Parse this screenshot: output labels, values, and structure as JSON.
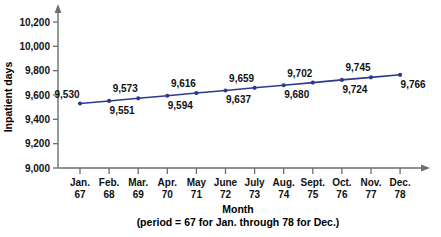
{
  "chart_data": {
    "type": "line",
    "title": "",
    "xlabel": "Month",
    "xlabel_sub": "(period = 67 for Jan. through 78 for Dec.)",
    "ylabel": "Inpatient days",
    "ylim": [
      9000,
      10200
    ],
    "ytick_step": 200,
    "grid": false,
    "legend": "none",
    "series_color": "#2b3a8f",
    "axis_color": "#6e6e6e",
    "categories": [
      "Jan.",
      "Feb.",
      "Mar.",
      "Apr.",
      "May",
      "June",
      "July",
      "Aug.",
      "Sept.",
      "Oct.",
      "Nov.",
      "Dec."
    ],
    "periods": [
      "67",
      "68",
      "69",
      "70",
      "71",
      "72",
      "73",
      "74",
      "75",
      "76",
      "77",
      "78"
    ],
    "values": [
      9530,
      9551,
      9573,
      9594,
      9616,
      9637,
      9659,
      9680,
      9702,
      9724,
      9745,
      9766
    ],
    "point_labels": [
      "9,530",
      "9,551",
      "9,573",
      "9,594",
      "9,616",
      "9,637",
      "9,659",
      "9,680",
      "9,702",
      "9,724",
      "9,745",
      "9,766"
    ],
    "ytick_labels": [
      "9,000",
      "9,200",
      "9,400",
      "9,600",
      "9,800",
      "10,000",
      "10,200"
    ],
    "ytick_values": [
      9000,
      9200,
      9400,
      9600,
      9800,
      10000,
      10200
    ],
    "label_positions": [
      "above",
      "below",
      "above",
      "below",
      "above",
      "below",
      "above",
      "below",
      "above",
      "below",
      "above",
      "below"
    ]
  }
}
